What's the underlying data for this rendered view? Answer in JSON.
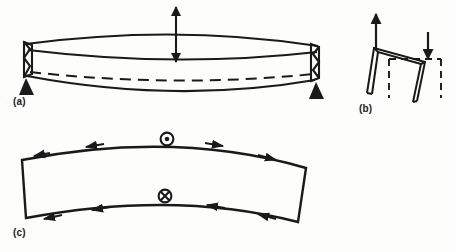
{
  "figure": {
    "background_color": "#fdfdfc",
    "ink_color": "#1a1a1a",
    "panels": [
      {
        "id": "a",
        "label": "(a)",
        "caption": "Simply supported beam in bending, shown in perspective",
        "elements": {
          "deflection_arrow_up": "upward arrow above beam midspan",
          "deflection_arrow_down": "downward arrow at beam midspan",
          "neutral_axis": "dashed neutral axis curve",
          "left_support": "pinned triangular support",
          "right_support": "pinned triangular support",
          "top_surface": "curved upper flange",
          "bottom_surface": "curved lower flange"
        }
      },
      {
        "id": "b",
        "label": "(b)",
        "caption": "Portal frame, deformed shape over dashed undeformed outline",
        "elements": {
          "load_arrow_up": "upward arrow at left joint",
          "load_arrow_down": "downward arrow at right joint",
          "undeformed_outline": "dashed original frame position",
          "deformed_frame": "solid deflected frame"
        }
      },
      {
        "id": "c",
        "label": "(c)",
        "caption": "Curved beam segment with shear flow arrows and axial vector symbols",
        "elements": {
          "vector_out_of_page": "circled dot symbol on top edge",
          "vector_into_page": "circled cross symbol on bottom edge",
          "top_shear_arrows": "shear flow arrows along top edge",
          "bottom_shear_arrows": "shear flow arrows along bottom edge",
          "segment_outline": "curved quadrilateral beam segment"
        }
      }
    ]
  },
  "labels": {
    "a": "(a)",
    "b": "(b)",
    "c": "(c)"
  }
}
